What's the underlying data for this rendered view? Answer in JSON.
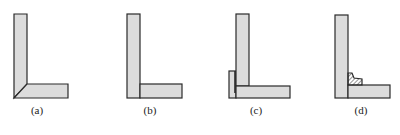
{
  "diagram": {
    "colors": {
      "fill": "#dcdcdc",
      "stroke": "#2a2a2a",
      "background": "#ffffff"
    },
    "panels": [
      {
        "id": "a",
        "label": "(a)",
        "joint": "mitered corner"
      },
      {
        "id": "b",
        "label": "(b)",
        "joint": "butt joint"
      },
      {
        "id": "c",
        "label": "(c)",
        "joint": "lapped corner with extension plate"
      },
      {
        "id": "d",
        "label": "(d)",
        "joint": "butt joint with fillet weld"
      }
    ]
  }
}
